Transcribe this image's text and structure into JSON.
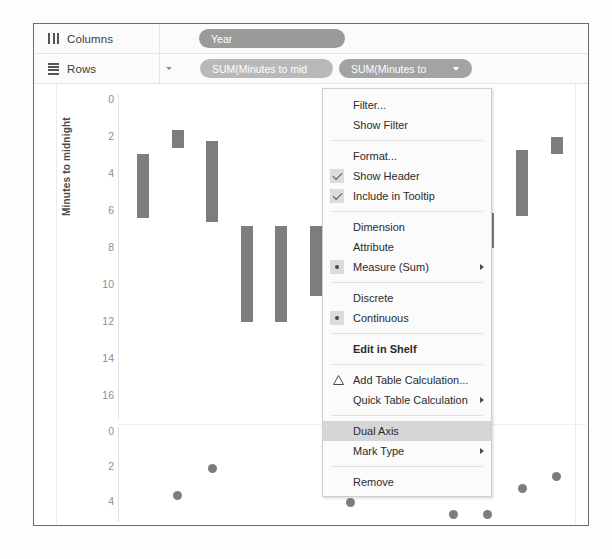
{
  "shelves": {
    "columns": {
      "label": "Columns",
      "icon": "columns-icon",
      "pills": [
        {
          "label": "Year",
          "color": "#9a9a9a",
          "has_caret": false
        }
      ]
    },
    "rows": {
      "label": "Rows",
      "icon": "rows-icon",
      "pills": [
        {
          "label": "SUM(Minutes to mid",
          "color": "#b9b9b9",
          "has_caret": false
        },
        {
          "label": "SUM(Minutes to",
          "color": "#a3a3a3",
          "has_caret": true
        }
      ]
    }
  },
  "context_menu": {
    "items": [
      {
        "label": "Filter...",
        "type": "item"
      },
      {
        "label": "Show Filter",
        "type": "item"
      },
      {
        "label": "",
        "type": "separator"
      },
      {
        "label": "Format...",
        "type": "item"
      },
      {
        "label": "Show Header",
        "type": "checkbox",
        "checked": true
      },
      {
        "label": "Include in Tooltip",
        "type": "checkbox",
        "checked": true
      },
      {
        "label": "",
        "type": "separator"
      },
      {
        "label": "Dimension",
        "type": "item"
      },
      {
        "label": "Attribute",
        "type": "item"
      },
      {
        "label": "Measure (Sum)",
        "type": "radio",
        "selected": true,
        "submenu": true
      },
      {
        "label": "",
        "type": "separator"
      },
      {
        "label": "Discrete",
        "type": "item"
      },
      {
        "label": "Continuous",
        "type": "radio",
        "selected": true
      },
      {
        "label": "",
        "type": "separator"
      },
      {
        "label": "Edit in Shelf",
        "type": "item",
        "bold": true
      },
      {
        "label": "",
        "type": "separator"
      },
      {
        "label": "Add Table Calculation...",
        "type": "item",
        "icon": "delta-icon"
      },
      {
        "label": "Quick Table Calculation",
        "type": "item",
        "submenu": true
      },
      {
        "label": "",
        "type": "separator"
      },
      {
        "label": "Dual Axis",
        "type": "item",
        "highlighted": true
      },
      {
        "label": "Mark Type",
        "type": "item",
        "submenu": true
      },
      {
        "label": "",
        "type": "separator"
      },
      {
        "label": "Remove",
        "type": "item"
      }
    ]
  },
  "chart_data": {
    "type": "bar",
    "title": "",
    "xlabel": "",
    "ylabel": "Minutes to midnight",
    "grid": false,
    "legend": "none",
    "panes": [
      {
        "name": "upper-pane",
        "ylabel": "Minutes to midnight",
        "yticks": [
          0,
          2,
          4,
          6,
          8,
          10,
          12,
          14,
          16
        ],
        "ylim": [
          0,
          17
        ],
        "type": "bar",
        "series": [
          {
            "name": "Minutes to midnight (range bars)",
            "bars": [
              {
                "low": 6.4,
                "high": 2.9
              },
              {
                "low": 2.6,
                "high": 1.6
              },
              {
                "low": 6.6,
                "high": 2.2
              },
              {
                "low": 12.0,
                "high": 6.8
              },
              {
                "low": 12.0,
                "high": 6.8
              },
              {
                "low": 10.6,
                "high": 6.8
              },
              {
                "low": 12.0,
                "high": 9.8
              },
              {
                "low": 11.8,
                "high": 9.3
              },
              {
                "low": 9.8,
                "high": 6.9
              },
              {
                "low": 7.0,
                "high": 3.0
              },
              {
                "low": 8.0,
                "high": 6.1
              },
              {
                "low": 6.3,
                "high": 2.7
              },
              {
                "low": 2.9,
                "high": 2.0
              }
            ]
          }
        ]
      },
      {
        "name": "lower-pane",
        "ylabel": "",
        "yticks": [
          0,
          2,
          4
        ],
        "ylim": [
          0,
          5
        ],
        "type": "scatter",
        "series": [
          {
            "name": "Minutes to midnight (points)",
            "points": [
              {
                "x": 1,
                "y": 3.6
              },
              {
                "x": 2,
                "y": 2.1
              },
              {
                "x": 6,
                "y": 4.0
              },
              {
                "x": 9,
                "y": 4.7
              },
              {
                "x": 10,
                "y": 4.7
              },
              {
                "x": 11,
                "y": 3.2
              },
              {
                "x": 12,
                "y": 2.5
              }
            ]
          }
        ]
      }
    ]
  },
  "colors": {
    "mark": "#7d7d7d",
    "pill_active": "#a3a3a3",
    "pill_inactive": "#b9b9b9",
    "pill_columns": "#9a9a9a",
    "menu_highlight": "#d6d6d6",
    "axis_text": "#8e8e8e"
  }
}
